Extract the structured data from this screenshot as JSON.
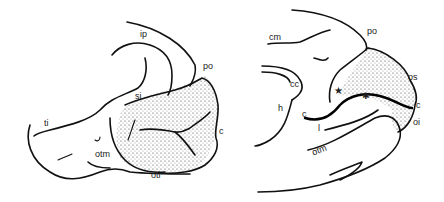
{
  "figure": {
    "left_panel": {
      "name": "lateral-view",
      "labels": [
        {
          "id": "ip",
          "text": "ip",
          "x": 140,
          "y": 36
        },
        {
          "id": "po",
          "text": "po",
          "x": 203,
          "y": 68
        },
        {
          "id": "si",
          "text": "si",
          "x": 135,
          "y": 98
        },
        {
          "id": "ti",
          "text": "ti",
          "x": 44,
          "y": 125
        },
        {
          "id": "c",
          "text": "c",
          "x": 220,
          "y": 133
        },
        {
          "id": "otm",
          "text": "otm",
          "x": 95,
          "y": 156
        },
        {
          "id": "oti",
          "text": "oti",
          "x": 151,
          "y": 175
        }
      ]
    },
    "right_panel": {
      "name": "medial-view",
      "labels": [
        {
          "id": "cm",
          "text": "cm",
          "x": 259,
          "y": 32
        },
        {
          "id": "po",
          "text": "po",
          "x": 367,
          "y": 31
        },
        {
          "id": "cc",
          "text": "cc",
          "x": 290,
          "y": 82
        },
        {
          "id": "os",
          "text": "os",
          "x": 408,
          "y": 76
        },
        {
          "id": "h",
          "text": "h",
          "x": 278,
          "y": 104
        },
        {
          "id": "c",
          "text": "c",
          "x": 302,
          "y": 113
        },
        {
          "id": "c2",
          "text": "c",
          "x": 416,
          "y": 104
        },
        {
          "id": "oi",
          "text": "oi",
          "x": 413,
          "y": 120
        },
        {
          "id": "l",
          "text": "l",
          "x": 318,
          "y": 127
        },
        {
          "id": "otm",
          "text": "otm",
          "x": 312,
          "y": 150
        }
      ],
      "markers": [
        {
          "id": "star-1",
          "glyph": "★",
          "x": 337,
          "y": 91
        },
        {
          "id": "star-2",
          "glyph": "✱",
          "x": 365,
          "y": 97
        }
      ]
    },
    "stipple_color": "#333333",
    "line_color": "#111111"
  }
}
